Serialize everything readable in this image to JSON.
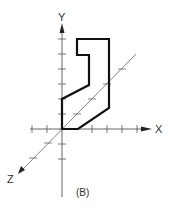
{
  "figure": {
    "caption": "(B)",
    "axes": {
      "x_label": "X",
      "y_label": "Y",
      "z_label": "Z",
      "origin": [
        62,
        129
      ],
      "tick_spacing": 15
    },
    "shape": {
      "description": "Isometric-style outline of an L/hook shaped profile",
      "points": [
        [
          77,
          39
        ],
        [
          109,
          39
        ],
        [
          109,
          108
        ],
        [
          78,
          129
        ],
        [
          62,
          129
        ],
        [
          62,
          99
        ],
        [
          89,
          85
        ],
        [
          89,
          55
        ],
        [
          77,
          55
        ]
      ]
    },
    "colors": {
      "axis": "#555555",
      "shape": "#111111",
      "text": "#333333"
    }
  }
}
